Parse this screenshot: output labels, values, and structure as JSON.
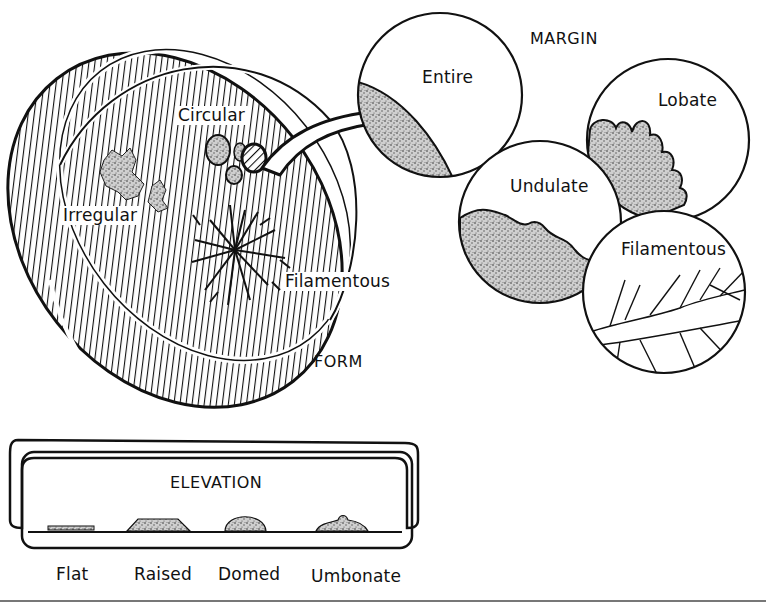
{
  "diagram": {
    "sections": {
      "form": {
        "heading": "FORM",
        "labels": [
          "Circular",
          "Irregular",
          "Filamentous"
        ]
      },
      "margin": {
        "heading": "MARGIN",
        "labels": [
          "Entire",
          "Lobate",
          "Undulate",
          "Filamentous"
        ]
      },
      "elevation": {
        "heading": "ELEVATION",
        "labels": [
          "Flat",
          "Raised",
          "Domed",
          "Umbonate"
        ]
      }
    },
    "connector": "arrow from circular colony edge to Entire margin magnifier"
  }
}
